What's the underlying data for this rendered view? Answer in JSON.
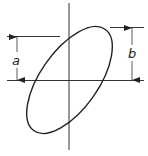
{
  "diagram": {
    "type": "lissajous-ellipse",
    "labels": {
      "a": "a",
      "b": "b"
    },
    "colors": {
      "stroke": "#222222",
      "background": "#ffffff"
    }
  }
}
